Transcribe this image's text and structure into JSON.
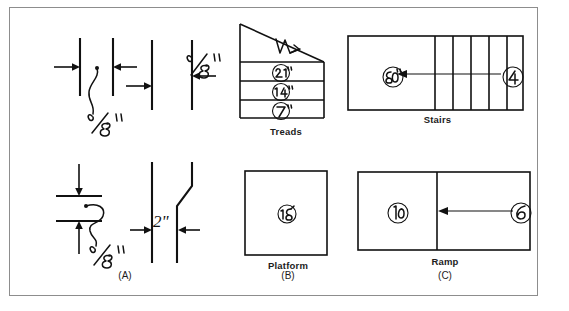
{
  "figure": {
    "background_color": "#ffffff",
    "border_color": "#8d8d8d",
    "ink_color": "#111111"
  },
  "columns": [
    {
      "id": "a",
      "label": "(A)"
    },
    {
      "id": "b",
      "label": "(B)"
    },
    {
      "id": "c",
      "label": "(C)"
    }
  ],
  "column_a": {
    "top_detail": {
      "name": "line-weight-gap-detail",
      "dimension_label": "1/8\"",
      "dimension_label_2": "1/8\"",
      "arrow_count": 4,
      "vertical_line_count": 4
    },
    "bottom_detail": {
      "name": "offset-break-detail",
      "dimension_label": "1/8\"",
      "dimension_label_2": "2\"",
      "arrow_count": 4,
      "vertical_line_count": 2
    }
  },
  "column_b": {
    "top_panel": {
      "caption": "Treads",
      "callouts": [
        "21\"",
        "14\"",
        "7\""
      ],
      "tread_row_count": 3,
      "has_diagonal_nosing_line": true
    },
    "bottom_panel": {
      "caption": "Platform",
      "callouts": [
        "18"
      ],
      "shape": "square"
    }
  },
  "column_c": {
    "top_panel": {
      "caption": "Stairs",
      "callouts": [
        "20",
        "4"
      ],
      "riser_division_count": 5,
      "arrow_direction": "right-to-left"
    },
    "bottom_panel": {
      "caption": "Ramp",
      "callouts": [
        "10",
        "6"
      ],
      "division_count": 1,
      "arrow_direction": "right-to-left"
    }
  }
}
